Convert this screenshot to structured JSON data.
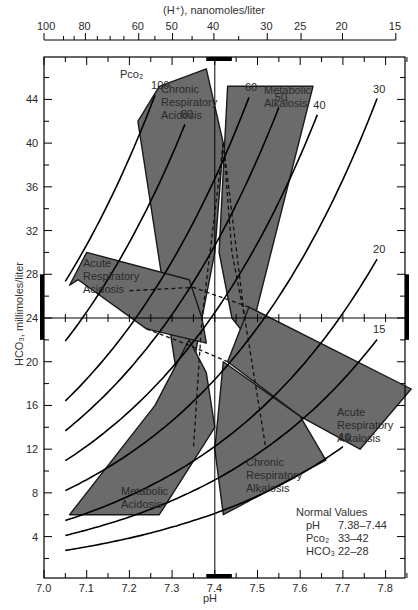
{
  "chart_data": {
    "type": "line",
    "xlabel": "pH",
    "ylabel": "HCO₃, millimoles/liter",
    "top_xlabel": "(H⁺), nanomoles/liter",
    "xlim": [
      7.0,
      7.85
    ],
    "ylim": [
      0,
      48
    ],
    "x_ticks": [
      "7.0",
      "7.1",
      "7.2",
      "7.3",
      "7.4",
      "7.5",
      "7.6",
      "7.7",
      "7.8"
    ],
    "y_ticks": [
      "4",
      "8",
      "12",
      "16",
      "20",
      "24",
      "28",
      "32",
      "36",
      "40",
      "44"
    ],
    "top_ticks": [
      "100",
      "80",
      "60",
      "50",
      "40",
      "30",
      "25",
      "20",
      "15"
    ],
    "pco2_label": "Pco₂",
    "isobars": [
      {
        "pco2": 100,
        "label": "100",
        "ph_range": [
          7.05,
          7.26
        ]
      },
      {
        "pco2": 80,
        "label": "80",
        "ph_range": [
          7.05,
          7.33
        ]
      },
      {
        "pco2": 60,
        "label": "60",
        "ph_range": [
          7.05,
          7.48
        ]
      },
      {
        "pco2": 50,
        "label": "50",
        "ph_range": [
          7.05,
          7.55
        ]
      },
      {
        "pco2": 40,
        "label": "40",
        "ph_range": [
          7.05,
          7.64
        ]
      },
      {
        "pco2": 30,
        "label": "30",
        "ph_range": [
          7.05,
          7.78
        ]
      },
      {
        "pco2": 20,
        "label": "20",
        "ph_range": [
          7.05,
          7.78
        ]
      },
      {
        "pco2": 15,
        "label": "15",
        "ph_range": [
          7.05,
          7.78
        ]
      },
      {
        "pco2": 10,
        "label": "10",
        "ph_range": [
          7.05,
          7.7
        ]
      }
    ],
    "regions": [
      {
        "name": "Chronic Respiratory Acidosis",
        "points": [
          [
            7.27,
            45.2
          ],
          [
            7.38,
            46.8
          ],
          [
            7.42,
            40
          ],
          [
            7.4,
            30
          ],
          [
            7.36,
            22
          ],
          [
            7.33,
            14
          ],
          [
            7.22,
            42
          ]
        ]
      },
      {
        "name": "Metabolic Alkalosis",
        "points": [
          [
            7.43,
            45.2
          ],
          [
            7.63,
            45.2
          ],
          [
            7.48,
            22
          ],
          [
            7.44,
            24
          ],
          [
            7.41,
            30
          ]
        ]
      },
      {
        "name": "Acute Respiratory Acidosis",
        "points": [
          [
            7.06,
            27
          ],
          [
            7.1,
            30
          ],
          [
            7.34,
            27.5
          ],
          [
            7.37,
            24
          ],
          [
            7.38,
            21.7
          ],
          [
            7.24,
            23
          ],
          [
            7.08,
            27.5
          ]
        ]
      },
      {
        "name": "Acute Respiratory Alkalosis",
        "points": [
          [
            7.48,
            25
          ],
          [
            7.86,
            17.5
          ],
          [
            7.74,
            12
          ],
          [
            7.6,
            15
          ],
          [
            7.43,
            20
          ]
        ]
      },
      {
        "name": "Chronic Respiratory Alkalosis",
        "points": [
          [
            7.42,
            20
          ],
          [
            7.6,
            15
          ],
          [
            7.66,
            11
          ],
          [
            7.42,
            6
          ],
          [
            7.4,
            12
          ]
        ]
      },
      {
        "name": "Metabolic Acidosis",
        "points": [
          [
            7.06,
            6
          ],
          [
            7.27,
            6
          ],
          [
            7.4,
            14
          ],
          [
            7.38,
            19
          ],
          [
            7.34,
            22
          ],
          [
            7.26,
            16
          ]
        ]
      }
    ],
    "labels": {
      "chronic_resp_acidosis": [
        "Chronic",
        "Respiratory",
        "Acidosis"
      ],
      "metabolic_alkalosis": [
        "Metabolic",
        "Alkalosis"
      ],
      "acute_resp_acidosis": [
        "Acute",
        "Respiratory",
        "Acidosis"
      ],
      "acute_resp_alkalosis": [
        "Acute",
        "Respiratory",
        "Alkalosis"
      ],
      "chronic_resp_alkalosis": [
        "Chronic",
        "Respiratory",
        "Alkalosis"
      ],
      "metabolic_acidosis": [
        "Metabolic",
        "Acidosis"
      ]
    },
    "normal_values": {
      "title": "Normal Values",
      "rows": [
        {
          "name": "pH",
          "value": "7.38–7.44"
        },
        {
          "name": "Pco₂",
          "value": "33–42"
        },
        {
          "name": "HCO₃",
          "value": "22–28"
        }
      ]
    },
    "normal_ranges": {
      "ph": [
        7.38,
        7.44
      ],
      "hco3": [
        22,
        28
      ]
    },
    "reference_lines": {
      "ph": 7.4,
      "hco3": 24
    }
  }
}
